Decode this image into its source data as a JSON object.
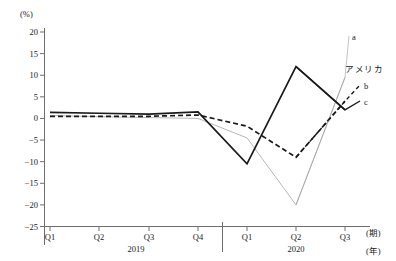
{
  "chart_data": {
    "type": "line",
    "title": "",
    "subtitle": "",
    "xlabel_period": "(期)",
    "xlabel_year": "(年)",
    "ylabel": "(%)",
    "ylim": [
      -25,
      20
    ],
    "ytick_step": 5,
    "yticks": [
      "20",
      "15",
      "10",
      "5",
      "0",
      "-5",
      "-10",
      "-15",
      "-20",
      "-25"
    ],
    "grid": false,
    "legend_position": "right",
    "x": [
      "Q1",
      "Q2",
      "Q3",
      "Q4",
      "Q1",
      "Q2",
      "Q3"
    ],
    "categories": [
      "Q1",
      "Q2",
      "Q3",
      "Q4",
      "Q1",
      "Q2",
      "Q3"
    ],
    "xtick_labels": [
      "Q1",
      "Q2",
      "Q3",
      "Q4",
      "Q1",
      "Q2",
      "Q3"
    ],
    "year_groups": [
      {
        "label": "2019",
        "quarters": [
          "Q1",
          "Q2",
          "Q3",
          "Q4"
        ]
      },
      {
        "label": "2020",
        "quarters": [
          "Q1",
          "Q2",
          "Q3"
        ]
      }
    ],
    "series": [
      {
        "name": "a",
        "style": "thin-gray",
        "values": [
          0.7,
          0.4,
          0.2,
          0.0,
          -4.5,
          -20.0,
          9.5
        ]
      },
      {
        "name": "b",
        "style": "dashed-black",
        "values": [
          0.5,
          0.5,
          0.5,
          0.8,
          -1.8,
          -9.0,
          4.0
        ]
      },
      {
        "name": "c",
        "style": "solid-black",
        "values": [
          1.4,
          1.2,
          1.0,
          1.5,
          -10.5,
          12.0,
          2.0
        ]
      }
    ],
    "annotations": [
      {
        "text": "a",
        "series": "a"
      },
      {
        "text": "アメリカ",
        "series": "b"
      },
      {
        "text": "b",
        "series": "b"
      },
      {
        "text": "c",
        "series": "c"
      }
    ],
    "colors": {
      "series_a": "#9a9a9a",
      "series_b": "#1a1a1a",
      "series_c": "#1a1a1a",
      "axis": "#6e6e6e",
      "text": "#1a1a1a",
      "background": "#ffffff"
    }
  }
}
